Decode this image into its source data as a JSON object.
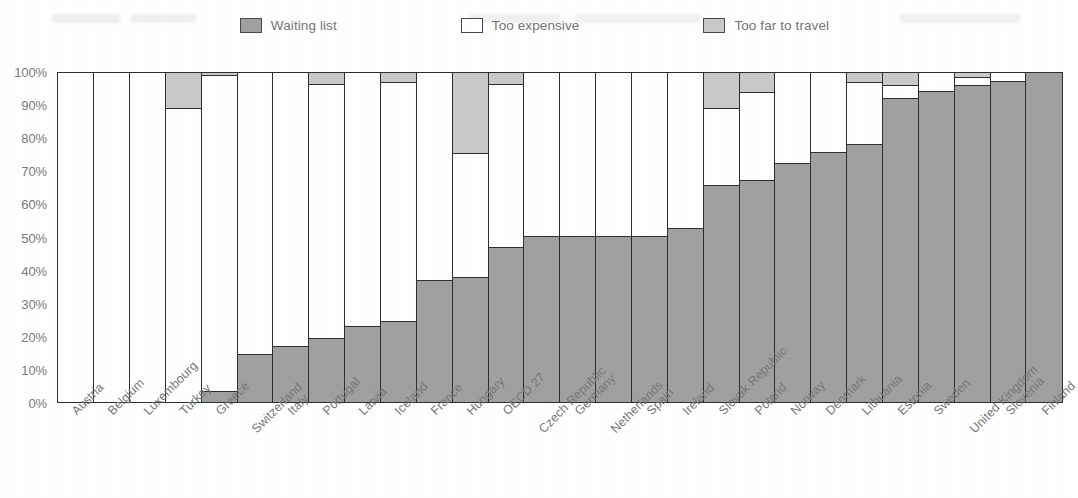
{
  "legend": {
    "items": [
      {
        "label": "Waiting list",
        "key": "waiting",
        "color": "#a0a0a0"
      },
      {
        "label": "Too expensive",
        "key": "expensive",
        "color": "#ffffff"
      },
      {
        "label": "Too far to travel",
        "key": "far",
        "color": "#c9c9c9"
      }
    ]
  },
  "axis": {
    "y_ticks": [
      "0%",
      "10%",
      "20%",
      "30%",
      "40%",
      "50%",
      "60%",
      "70%",
      "80%",
      "90%",
      "100%"
    ],
    "y_min": 0,
    "y_max": 100
  },
  "chart_data": {
    "type": "bar",
    "stacked": true,
    "title": "",
    "subtitle": "",
    "xlabel": "",
    "ylabel": "",
    "ylim": [
      0,
      100
    ],
    "ytick_labels": [
      "0%",
      "10%",
      "20%",
      "30%",
      "40%",
      "50%",
      "60%",
      "70%",
      "80%",
      "90%",
      "100%"
    ],
    "grid": false,
    "legend_position": "top",
    "categories": [
      "Austria",
      "Belgium",
      "Luxembourg",
      "Turkey",
      "Greece",
      "Switzerland",
      "Italy",
      "Portugal",
      "Latvia",
      "Iceland",
      "France",
      "Hungary",
      "OECD 27",
      "Czech Republic",
      "Germany",
      "Netherlands",
      "Spain",
      "Ireland",
      "Slovak Republic",
      "Poland",
      "Norway",
      "Denmark",
      "Lithuania",
      "Estonia",
      "Sweden",
      "United Kingdom",
      "Slovenia",
      "Finland"
    ],
    "series": [
      {
        "name": "Waiting list",
        "color": "#a0a0a0",
        "values": [
          0,
          0,
          0,
          0,
          3.5,
          14.5,
          17,
          19.5,
          23,
          24.5,
          37,
          38,
          47,
          50.5,
          50.5,
          50.5,
          50.5,
          53,
          66,
          67.5,
          72.5,
          76,
          78.5,
          92.5,
          94.5,
          96.5,
          97.5,
          100
        ]
      },
      {
        "name": "Too expensive",
        "color": "#ffffff",
        "values": [
          100,
          100,
          100,
          89,
          95.5,
          85.5,
          83,
          77,
          77,
          72.5,
          63,
          37.5,
          49.5,
          49.5,
          49.5,
          49.5,
          49.5,
          47,
          23,
          26.5,
          27.5,
          24,
          18.5,
          3.5,
          5.5,
          2,
          2.5,
          0
        ]
      },
      {
        "name": "Too far to travel",
        "color": "#c9c9c9",
        "values": [
          0,
          0,
          0,
          11,
          1,
          0,
          0,
          3.5,
          0,
          3,
          0,
          24.5,
          3.5,
          0,
          0,
          0,
          0,
          0,
          11,
          6,
          0,
          0,
          3,
          4,
          0,
          1.5,
          0,
          0
        ]
      }
    ]
  }
}
